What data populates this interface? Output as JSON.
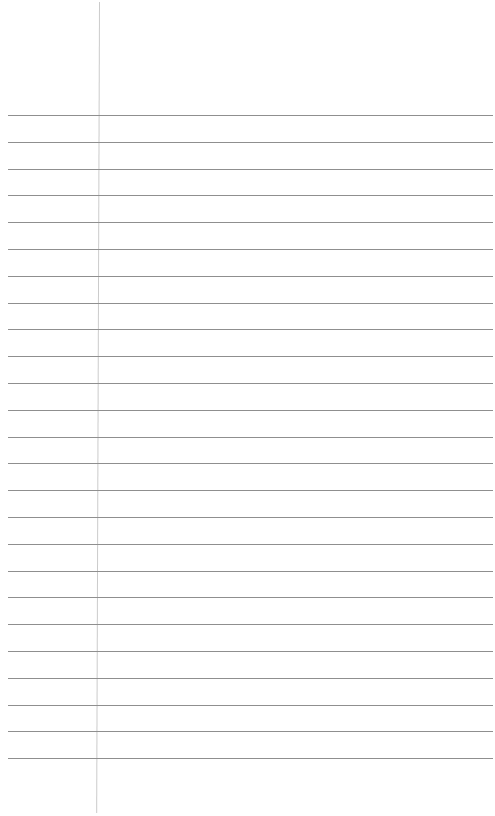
{
  "document": {
    "type": "lined-paper",
    "background_color": "#ffffff",
    "rule_color": "#8f8f8f",
    "margin_color": "#cbcbcb",
    "margin_x": 99,
    "rule_left": 8,
    "rule_right": 493,
    "first_rule_y": 115,
    "rule_spacing": 26.8,
    "rule_count": 25,
    "text_lines": []
  }
}
